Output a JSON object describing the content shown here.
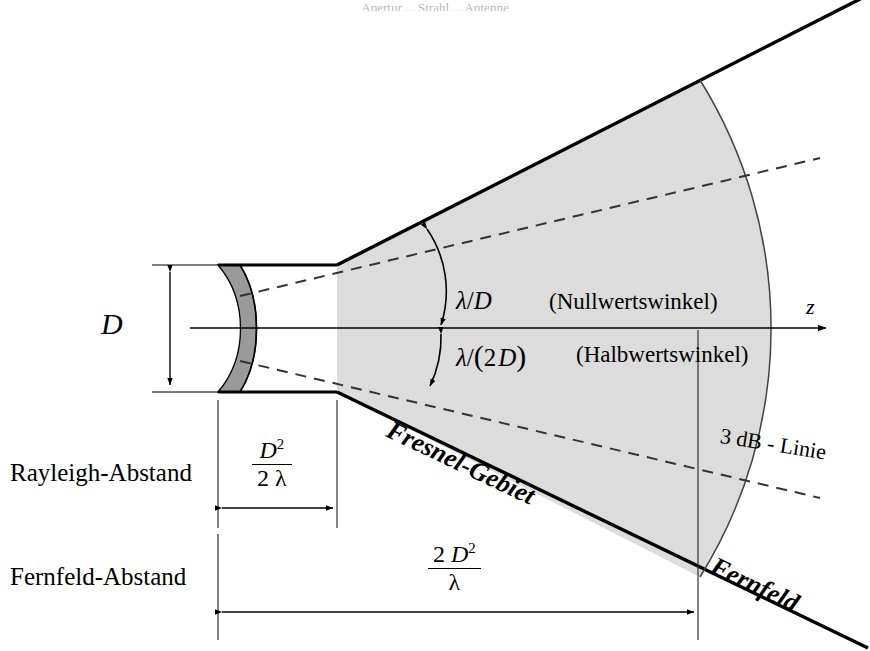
{
  "figure": {
    "type": "antenna-beam-regions-diagram",
    "language": "de",
    "cropped_caption_fragment": "Apertur ... Strahl ... Antenne",
    "colors": {
      "beam_fill": "#dcdcdc",
      "aperture_fill": "#9a9a9a",
      "stroke": "#000000",
      "thin_stroke": "#3a3a3a"
    }
  },
  "labels": {
    "aperture_diameter": "D",
    "axis": "z",
    "null_angle_formula_num": "λ/",
    "null_angle_formula": "λ/D",
    "null_angle_name": "(Nullwertswinkel)",
    "half_angle_formula": "λ/(2 D)",
    "half_angle_name": "(Halbwertswinkel)",
    "half_angle_lambda": "λ/",
    "half_angle_paren_open": "(",
    "half_angle_two": "2",
    "half_angle_D": "D",
    "half_angle_paren_close": ")",
    "three_db_line": "3 dB - Linie",
    "fresnel_region": "Fresnel-Gebiet",
    "far_field_region": "Fernfeld",
    "rayleigh_distance": "Rayleigh-Abstand",
    "far_field_distance": "Fernfeld-Abstand"
  },
  "formulas": {
    "rayleigh": {
      "numerator": "D",
      "numerator_exp": "2",
      "denominator": "2 λ"
    },
    "far_field": {
      "numerator_coeff": "2 ",
      "numerator": "D",
      "numerator_exp": "2",
      "denominator": "λ"
    }
  },
  "geometry": {
    "axis_y": 328,
    "aperture_x_left": 218,
    "aperture_x_right": 337,
    "aperture_top_y": 265,
    "aperture_bottom_y": 392,
    "far_field_boundary_x": 698,
    "rayleigh_dim_y": 508,
    "far_field_dim_y": 612
  }
}
